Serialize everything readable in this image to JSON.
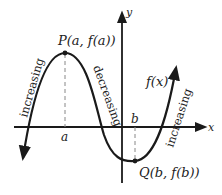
{
  "diagram": {
    "type": "function-graph",
    "axes": {
      "x_label": "x",
      "y_label": "y"
    },
    "curve_label": "f(x)",
    "points": {
      "max": {
        "label": "P(a, f(a))",
        "x_tick": "a"
      },
      "min": {
        "label": "Q(b, f(b))",
        "x_tick": "b"
      }
    },
    "intervals": [
      {
        "label": "increasing",
        "region": "left of a"
      },
      {
        "label": "decreasing",
        "region": "between a and b"
      },
      {
        "label": "increasing",
        "region": "right of b"
      }
    ],
    "colors": {
      "curve": "#1a1a1a",
      "axes": "#1a1a1a",
      "dashed": "#888888",
      "text": "#222222"
    }
  }
}
